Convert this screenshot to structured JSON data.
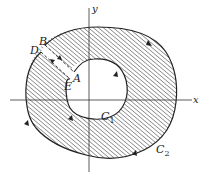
{
  "diagram": {
    "type": "annular-region-contour",
    "axes": {
      "x_label": "x",
      "y_label": "y"
    },
    "points": {
      "A": "A",
      "B": "B",
      "D": "D",
      "E": "E"
    },
    "curves": {
      "inner": {
        "label": "C",
        "subscript": "1"
      },
      "outer": {
        "label": "C",
        "subscript": "2"
      }
    },
    "colors": {
      "line": "#222222",
      "hatch": "#555555",
      "background": "#ffffff"
    }
  }
}
